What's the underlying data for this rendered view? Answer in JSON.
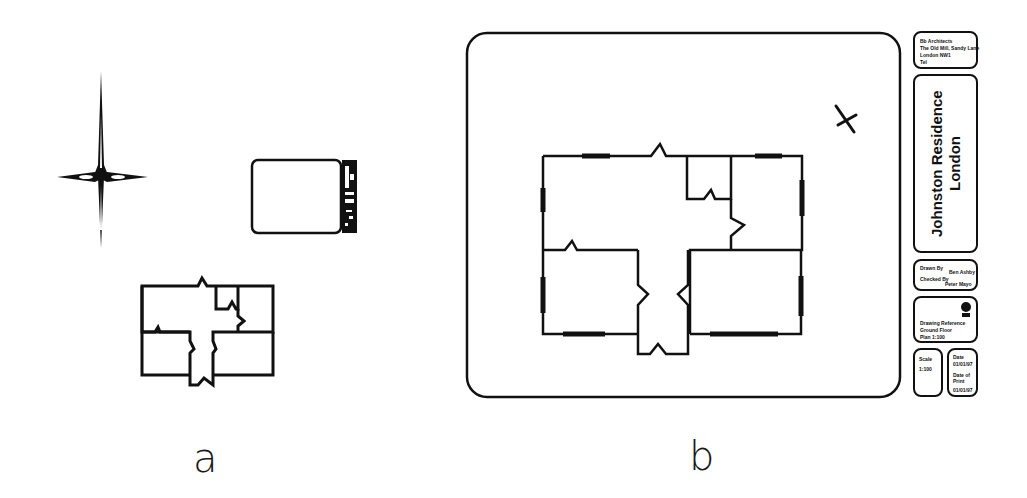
{
  "figure": {
    "panels": [
      {
        "id": "a",
        "label": "a",
        "elements": [
          "north-arrow",
          "title-block-thumbnail",
          "floor-plan-thumbnail"
        ]
      },
      {
        "id": "b",
        "label": "b",
        "elements": [
          "drawing-frame",
          "floor-plan",
          "north-arrow",
          "title-block"
        ]
      }
    ]
  },
  "panel_a": {
    "label": "a"
  },
  "panel_b": {
    "label": "b",
    "title_block": {
      "logo_box": {
        "line1": "Bb Architects",
        "line2": "The Old Mill, Sandy Lane",
        "line3": "London NW1",
        "line4": "Tel"
      },
      "project_title": "Johnston Residence",
      "project_location": "London",
      "drawn_by_label": "Drawn By",
      "drawn_by_value": "Ben Ashby",
      "checked_by_label": "Checked By",
      "checked_by_value": "Peter Mayo",
      "stamp_box": {
        "line1": "Drawing Reference",
        "line2": "Ground Floor",
        "line3": "Plan 1:100",
        "stamp": "seal"
      },
      "scale_label": "Scale",
      "scale_value": "1:100",
      "date_label": "Date",
      "date_value": "01/01/97",
      "print_date_label": "Date of Print",
      "print_date_value": "01/01/97"
    }
  },
  "colors": {
    "line": "#111111",
    "background": "#ffffff"
  }
}
